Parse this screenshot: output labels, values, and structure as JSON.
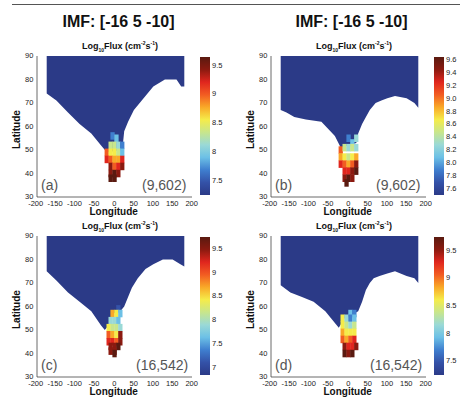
{
  "header": {
    "left_title": "IMF: [-16 5 -10]",
    "right_title": "IMF: [-16 5 -10]"
  },
  "colors": {
    "background_region": "#2b3a87",
    "frame": "#444444",
    "colormap": [
      "#2b3a87",
      "#3452a8",
      "#3f7fcf",
      "#6cc0e6",
      "#9ad9d6",
      "#c8e68c",
      "#f5ec4a",
      "#f9a928",
      "#f25c22",
      "#e0261e",
      "#8b1a10",
      "#5a1a10"
    ]
  },
  "axes": {
    "xlabel": "Longitude",
    "ylabel": "Latitude",
    "xticks": [
      "-200",
      "-150",
      "-100",
      "-50",
      "0",
      "50",
      "100",
      "150",
      "200"
    ],
    "yticks": [
      "30",
      "40",
      "50",
      "60",
      "70",
      "80",
      "90"
    ],
    "title_main": "Log",
    "title_sub": "10",
    "title_rest": "Flux (cm",
    "title_sup1": "-2",
    "title_s": "s",
    "title_sup2": "-1",
    "title_close": ")"
  },
  "chart_data": [
    {
      "type": "heatmap",
      "panel": "a",
      "label": "(a)",
      "annotation": "(9,602)",
      "title": "Log10Flux (cm-2s-1)",
      "xlabel": "Longitude",
      "ylabel": "Latitude",
      "xlim": [
        -200,
        200
      ],
      "ylim": [
        30,
        90
      ],
      "colorbar": {
        "min": 7.25,
        "max": 9.65,
        "ticks": [
          "7.5",
          "8",
          "8.5",
          "9",
          "9.5"
        ],
        "tick_values": [
          7.5,
          8,
          8.5,
          9,
          9.5
        ]
      },
      "region_boundary": [
        [
          -175,
          90
        ],
        [
          180,
          90
        ],
        [
          180,
          77
        ],
        [
          172,
          77
        ],
        [
          160,
          80
        ],
        [
          130,
          80
        ],
        [
          100,
          77
        ],
        [
          75,
          72
        ],
        [
          50,
          67
        ],
        [
          35,
          62
        ],
        [
          25,
          58
        ],
        [
          20,
          50
        ],
        [
          -20,
          49
        ],
        [
          -35,
          52
        ],
        [
          -60,
          57
        ],
        [
          -90,
          61
        ],
        [
          -120,
          66
        ],
        [
          -150,
          71
        ],
        [
          -175,
          74
        ]
      ],
      "cusp_cells": [
        [
          -5,
          56,
          7.7
        ],
        [
          5,
          55,
          7.9
        ],
        [
          -10,
          52,
          8.4
        ],
        [
          0,
          52,
          8.3
        ],
        [
          10,
          52,
          8.1
        ],
        [
          20,
          52,
          7.6
        ],
        [
          -20,
          49,
          9.0
        ],
        [
          -10,
          49,
          8.6
        ],
        [
          0,
          49,
          8.5
        ],
        [
          10,
          49,
          8.3
        ],
        [
          20,
          49,
          8.0
        ],
        [
          -20,
          46,
          9.2
        ],
        [
          -10,
          46,
          8.9
        ],
        [
          0,
          46,
          8.8
        ],
        [
          10,
          46,
          8.7
        ],
        [
          20,
          46,
          9.3
        ],
        [
          -10,
          43,
          9.4
        ],
        [
          0,
          43,
          9.1
        ],
        [
          10,
          43,
          9.3
        ],
        [
          20,
          43,
          9.5
        ],
        [
          -10,
          40,
          9.5
        ],
        [
          0,
          40,
          9.6
        ],
        [
          10,
          40,
          9.4
        ],
        [
          -10,
          38,
          9.7
        ],
        [
          0,
          38,
          9.6
        ]
      ]
    },
    {
      "type": "heatmap",
      "panel": "b",
      "label": "(b)",
      "annotation": "(9,602)",
      "title": "Log10Flux (cm-2s-1)",
      "xlabel": "Longitude",
      "ylabel": "Latitude",
      "xlim": [
        -200,
        200
      ],
      "ylim": [
        30,
        90
      ],
      "colorbar": {
        "min": 7.5,
        "max": 9.65,
        "ticks": [
          "7.6",
          "7.8",
          "8.0",
          "8.2",
          "8.4",
          "8.6",
          "8.8",
          "9.0",
          "9.2",
          "9.4",
          "9.6"
        ],
        "tick_values": [
          7.6,
          7.8,
          8.0,
          8.2,
          8.4,
          8.6,
          8.8,
          9.0,
          9.2,
          9.4,
          9.6
        ]
      },
      "region_boundary": [
        [
          -175,
          90
        ],
        [
          180,
          90
        ],
        [
          180,
          68
        ],
        [
          170,
          70
        ],
        [
          150,
          72
        ],
        [
          120,
          73
        ],
        [
          100,
          72
        ],
        [
          85,
          71
        ],
        [
          70,
          70
        ],
        [
          55,
          67
        ],
        [
          45,
          64
        ],
        [
          35,
          61
        ],
        [
          25,
          57
        ],
        [
          20,
          53
        ],
        [
          -20,
          51
        ],
        [
          -35,
          56
        ],
        [
          -70,
          62
        ],
        [
          -110,
          63
        ],
        [
          -140,
          64
        ],
        [
          -160,
          66
        ],
        [
          -175,
          67
        ]
      ],
      "cusp_cells": [
        [
          0,
          55,
          7.8
        ],
        [
          10,
          53,
          8.1
        ],
        [
          20,
          55,
          8.2
        ],
        [
          -20,
          50,
          9.0
        ],
        [
          -10,
          51,
          8.5
        ],
        [
          0,
          51,
          8.3
        ],
        [
          10,
          51,
          8.4
        ],
        [
          20,
          51,
          8.3
        ],
        [
          -20,
          47,
          8.8
        ],
        [
          -10,
          47,
          8.6
        ],
        [
          0,
          47,
          8.5
        ],
        [
          10,
          47,
          8.6
        ],
        [
          20,
          47,
          8.8
        ],
        [
          -20,
          44,
          9.3
        ],
        [
          -10,
          44,
          9.0
        ],
        [
          0,
          44,
          8.9
        ],
        [
          10,
          44,
          9.1
        ],
        [
          20,
          44,
          9.4
        ],
        [
          -10,
          41,
          9.3
        ],
        [
          0,
          41,
          9.2
        ],
        [
          10,
          41,
          9.4
        ],
        [
          20,
          41,
          9.6
        ],
        [
          -10,
          38,
          9.5
        ],
        [
          0,
          38,
          9.6
        ],
        [
          10,
          38,
          9.5
        ],
        [
          -5,
          36,
          9.7
        ]
      ]
    },
    {
      "type": "heatmap",
      "panel": "c",
      "label": "(c)",
      "annotation": "(16,542)",
      "title": "Log10Flux (cm-2s-1)",
      "xlabel": "Longitude",
      "ylabel": "Latitude",
      "xlim": [
        -200,
        200
      ],
      "ylim": [
        30,
        90
      ],
      "colorbar": {
        "min": 6.85,
        "max": 9.75,
        "ticks": [
          "7",
          "7.5",
          "8",
          "8.5",
          "9",
          "9.5"
        ],
        "tick_values": [
          7,
          7.5,
          8,
          8.5,
          9,
          9.5
        ]
      },
      "region_boundary": [
        [
          -175,
          90
        ],
        [
          180,
          90
        ],
        [
          180,
          77
        ],
        [
          170,
          78
        ],
        [
          150,
          80
        ],
        [
          125,
          80
        ],
        [
          100,
          78
        ],
        [
          80,
          76
        ],
        [
          60,
          72
        ],
        [
          45,
          68
        ],
        [
          35,
          64
        ],
        [
          25,
          60
        ],
        [
          15,
          58
        ],
        [
          -5,
          57
        ],
        [
          -15,
          52
        ],
        [
          -25,
          50
        ],
        [
          -35,
          52
        ],
        [
          -60,
          58
        ],
        [
          -90,
          62
        ],
        [
          -120,
          66
        ],
        [
          -150,
          71
        ],
        [
          -175,
          75
        ]
      ],
      "cusp_cells": [
        [
          10,
          59,
          7.2
        ],
        [
          -5,
          57,
          8.6
        ],
        [
          5,
          57,
          8.3
        ],
        [
          15,
          57,
          7.6
        ],
        [
          -10,
          54,
          8.0
        ],
        [
          0,
          54,
          7.9
        ],
        [
          10,
          54,
          7.6
        ],
        [
          -15,
          51,
          8.3
        ],
        [
          -5,
          51,
          8.1
        ],
        [
          5,
          51,
          8.2
        ],
        [
          15,
          51,
          7.8
        ],
        [
          -15,
          48,
          8.9
        ],
        [
          -5,
          48,
          8.6
        ],
        [
          5,
          48,
          8.5
        ],
        [
          15,
          48,
          9.5
        ],
        [
          -15,
          45,
          9.3
        ],
        [
          -5,
          45,
          9.2
        ],
        [
          5,
          45,
          9.0
        ],
        [
          15,
          45,
          9.6
        ],
        [
          -10,
          43,
          9.5
        ],
        [
          0,
          43,
          9.4
        ],
        [
          10,
          43,
          9.7
        ],
        [
          -10,
          41,
          9.6
        ],
        [
          0,
          41,
          9.5
        ],
        [
          0,
          40,
          9.8
        ]
      ]
    },
    {
      "type": "heatmap",
      "panel": "d",
      "label": "(d)",
      "annotation": "(16,542)",
      "title": "Log10Flux (cm-2s-1)",
      "xlabel": "Longitude",
      "ylabel": "Latitude",
      "xlim": [
        -200,
        200
      ],
      "ylim": [
        30,
        90
      ],
      "colorbar": {
        "min": 7.25,
        "max": 9.75,
        "ticks": [
          "7.5",
          "8",
          "8.5",
          "9",
          "9.5"
        ],
        "tick_values": [
          7.5,
          8,
          8.5,
          9,
          9.5
        ]
      },
      "region_boundary": [
        [
          -175,
          90
        ],
        [
          180,
          90
        ],
        [
          180,
          70
        ],
        [
          170,
          72
        ],
        [
          150,
          73
        ],
        [
          120,
          75
        ],
        [
          100,
          74
        ],
        [
          80,
          73
        ],
        [
          65,
          72
        ],
        [
          55,
          70
        ],
        [
          45,
          67
        ],
        [
          35,
          62
        ],
        [
          25,
          58
        ],
        [
          15,
          57
        ],
        [
          -10,
          55
        ],
        [
          -25,
          51
        ],
        [
          -35,
          53
        ],
        [
          -60,
          58
        ],
        [
          -90,
          62
        ],
        [
          -120,
          64
        ],
        [
          -150,
          66
        ],
        [
          -175,
          69
        ]
      ],
      "cusp_cells": [
        [
          5,
          57,
          7.9
        ],
        [
          15,
          57,
          7.7
        ],
        [
          -15,
          55,
          8.7
        ],
        [
          -5,
          55,
          8.2
        ],
        [
          5,
          55,
          7.7
        ],
        [
          15,
          55,
          7.9
        ],
        [
          -15,
          52,
          8.6
        ],
        [
          -5,
          52,
          8.3
        ],
        [
          5,
          52,
          8.1
        ],
        [
          15,
          52,
          8.4
        ],
        [
          -15,
          49,
          8.8
        ],
        [
          -5,
          49,
          8.6
        ],
        [
          5,
          49,
          8.5
        ],
        [
          15,
          49,
          8.7
        ],
        [
          -15,
          46,
          9.0
        ],
        [
          -5,
          46,
          8.9
        ],
        [
          5,
          46,
          9.0
        ],
        [
          15,
          46,
          9.3
        ],
        [
          -10,
          43,
          9.5
        ],
        [
          0,
          43,
          9.4
        ],
        [
          10,
          43,
          9.4
        ],
        [
          20,
          43,
          9.6
        ],
        [
          -10,
          40,
          9.7
        ],
        [
          0,
          40,
          9.6
        ],
        [
          10,
          40,
          9.7
        ]
      ]
    }
  ]
}
